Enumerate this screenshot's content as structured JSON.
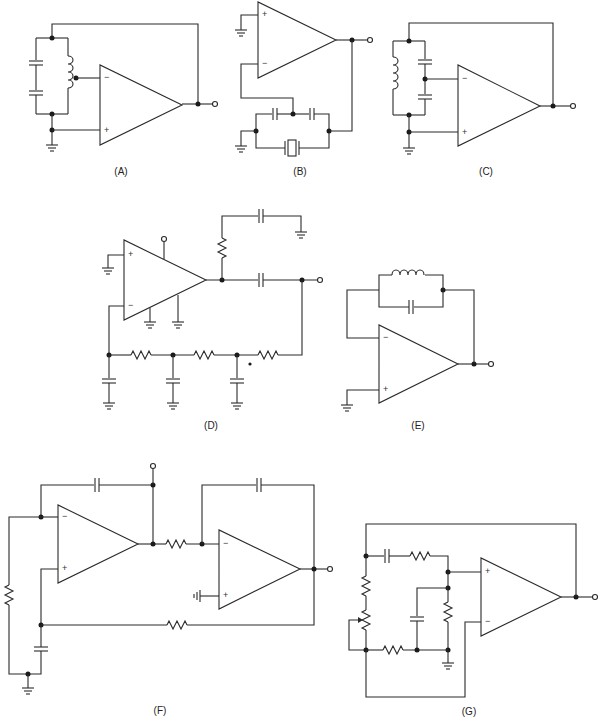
{
  "figure": {
    "panels": [
      {
        "id": "A",
        "label": "(A)",
        "description": "Hartley-type oscillator: tapped inductor in parallel with two series capacitors, tap to inverting input, non-inverting input grounded, output fed back to top of tank"
      },
      {
        "id": "B",
        "label": "(B)",
        "description": "Pierce-type crystal oscillator: two series capacitors with midpoint to inverting input, crystal across the capacitor string, non-inverting input grounded"
      },
      {
        "id": "C",
        "label": "(C)",
        "description": "Colpitts-type oscillator: inductor in parallel with two series capacitors, capacitor midpoint to inverting input, output fed back to top of tank"
      },
      {
        "id": "D",
        "label": "(D)",
        "description": "Phase-shift oscillator: three-section RC ladder from output coupling capacitor back to inverting input, output RC network to ground"
      },
      {
        "id": "E",
        "label": "(E)",
        "description": "Parallel LC tank in feedback path from output to inverting input, non-inverting input grounded"
      },
      {
        "id": "F",
        "label": "(F)",
        "description": "Two-op-amp quadrature oscillator: integrator stages with capacitor feedback, resistor coupling between stages, RC network to non-inverting input"
      },
      {
        "id": "G",
        "label": "(G)",
        "description": "Wien-bridge oscillator: series RC and parallel RC to non-inverting input, resistor and potentiometer divider to inverting input"
      }
    ],
    "pin_labels": {
      "inverting": "−",
      "noninverting": "+"
    }
  }
}
